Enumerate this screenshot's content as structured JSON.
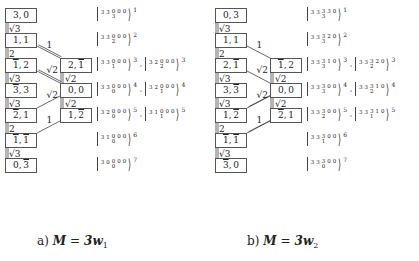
{
  "panels": [
    {
      "id": "a",
      "caption": {
        "prefix": "a)",
        "lhs": "M",
        "eq": "=",
        "rhs": "3w",
        "sub": "1"
      },
      "left_column": [
        {
          "a": "3",
          "a_bar": false,
          "b": "0",
          "b_bar": false
        },
        {
          "a": "1",
          "a_bar": false,
          "b": "1",
          "b_bar": false
        },
        {
          "a": "1",
          "a_bar": true,
          "b": "2",
          "b_bar": false
        },
        {
          "a": "3",
          "a_bar": true,
          "b": "3",
          "b_bar": false
        },
        {
          "a": "2",
          "a_bar": true,
          "b": "1",
          "b_bar": false
        },
        {
          "a": "1",
          "a_bar": true,
          "b": "1",
          "b_bar": true
        },
        {
          "a": "0",
          "a_bar": false,
          "b": "3",
          "b_bar": true
        }
      ],
      "left_links": [
        "√3",
        "2",
        "√3",
        "√3",
        "2",
        "√3"
      ],
      "right_column": [
        {
          "row": 3,
          "a": "2",
          "a_bar": false,
          "b": "1",
          "b_bar": true
        },
        {
          "row": 4,
          "a": "0",
          "a_bar": false,
          "b": "0",
          "b_bar": false
        },
        {
          "row": 5,
          "a": "1",
          "a_bar": false,
          "b": "2",
          "b_bar": true
        }
      ],
      "right_links": [
        "√2",
        "√2"
      ],
      "cross_links": [
        {
          "from_row": 2,
          "to_row": 3,
          "label": "1",
          "style": "double"
        },
        {
          "from_row": 3,
          "to_row": 4,
          "label": "√2",
          "style": "double"
        },
        {
          "from_row": 4,
          "to_row": 5,
          "label": "√2",
          "style": "single"
        },
        {
          "from_row": 5,
          "to_row": 6,
          "label": "1",
          "style": "single"
        }
      ],
      "kets": [
        [
          {
            "t": [
              "3",
              "3",
              "0",
              "0",
              "0"
            ],
            "mid_low": "3",
            "sup": "1"
          }
        ],
        [
          {
            "t": [
              "3",
              "3",
              "0",
              "0",
              "0"
            ],
            "mid_low": "2",
            "sup": "2"
          }
        ],
        [
          {
            "t": [
              "3",
              "3",
              "0",
              "0",
              "0"
            ],
            "mid_low": "1",
            "sup": "3"
          },
          {
            "t": [
              "3",
              "2",
              "0",
              "0",
              "0"
            ],
            "mid_low": "2",
            "sup": "3"
          }
        ],
        [
          {
            "t": [
              "3",
              "3",
              "0",
              "0",
              "0"
            ],
            "mid_low": "0",
            "sup": "4"
          },
          {
            "t": [
              "3",
              "2",
              "0",
              "0",
              "0"
            ],
            "mid_low": "1",
            "sup": "4"
          }
        ],
        [
          {
            "t": [
              "3",
              "2",
              "0",
              "0",
              "0"
            ],
            "mid_low": "0",
            "sup": "5"
          },
          {
            "t": [
              "3",
              "1",
              "0",
              "0",
              "0"
            ],
            "mid_low": "1",
            "sup": "5"
          }
        ],
        [
          {
            "t": [
              "3",
              "1",
              "0",
              "0",
              "0"
            ],
            "mid_low": "0",
            "sup": "6"
          }
        ],
        [
          {
            "t": [
              "3",
              "0",
              "0",
              "0",
              "0"
            ],
            "mid_low": "0",
            "sup": "7"
          }
        ]
      ]
    },
    {
      "id": "b",
      "caption": {
        "prefix": "b)",
        "lhs": "M",
        "eq": "=",
        "rhs": "3w",
        "sub": "2"
      },
      "left_column": [
        {
          "a": "0",
          "a_bar": false,
          "b": "3",
          "b_bar": false
        },
        {
          "a": "1",
          "a_bar": false,
          "b": "1",
          "b_bar": false
        },
        {
          "a": "2",
          "a_bar": false,
          "b": "1",
          "b_bar": true
        },
        {
          "a": "3",
          "a_bar": false,
          "b": "3",
          "b_bar": true
        },
        {
          "a": "1",
          "a_bar": false,
          "b": "2",
          "b_bar": true
        },
        {
          "a": "1",
          "a_bar": true,
          "b": "1",
          "b_bar": true
        },
        {
          "a": "3",
          "a_bar": true,
          "b": "0",
          "b_bar": false
        }
      ],
      "left_links": [
        "√3",
        "2",
        "√3",
        "√3",
        "2",
        "√3"
      ],
      "right_column": [
        {
          "row": 3,
          "a": "1",
          "a_bar": true,
          "b": "2",
          "b_bar": false
        },
        {
          "row": 4,
          "a": "0",
          "a_bar": false,
          "b": "0",
          "b_bar": false
        },
        {
          "row": 5,
          "a": "2",
          "a_bar": true,
          "b": "1",
          "b_bar": false
        }
      ],
      "right_links": [
        "√2",
        "√2"
      ],
      "cross_links": [
        {
          "from_row": 2,
          "to_row": 3,
          "label": "1",
          "style": "single"
        },
        {
          "from_row": 3,
          "to_row": 4,
          "label": "√2",
          "style": "single"
        },
        {
          "from_row": 4,
          "to_row": 5,
          "label": "√2",
          "style": "double"
        },
        {
          "from_row": 5,
          "to_row": 6,
          "label": "1",
          "style": "double"
        }
      ],
      "kets": [
        [
          {
            "t": [
              "3",
              "3",
              "3",
              "3",
              "0"
            ],
            "mid_low": "3",
            "sup": "1"
          }
        ],
        [
          {
            "t": [
              "3",
              "3",
              "3",
              "2",
              "0"
            ],
            "mid_low": "3",
            "sup": "2"
          }
        ],
        [
          {
            "t": [
              "3",
              "3",
              "3",
              "1",
              "0"
            ],
            "mid_low": "3",
            "sup": "3"
          },
          {
            "t": [
              "3",
              "3",
              "3",
              "2",
              "0"
            ],
            "mid_low": "2",
            "sup": "3"
          }
        ],
        [
          {
            "t": [
              "3",
              "3",
              "3",
              "0",
              "0"
            ],
            "mid_low": "3",
            "sup": "4"
          },
          {
            "t": [
              "3",
              "3",
              "3",
              "1",
              "0"
            ],
            "mid_low": "2",
            "sup": "4"
          }
        ],
        [
          {
            "t": [
              "3",
              "3",
              "3",
              "0",
              "0"
            ],
            "mid_low": "2",
            "sup": "5"
          },
          {
            "t": [
              "3",
              "3",
              "3",
              "1",
              "0"
            ],
            "mid_low": "1",
            "sup": "5"
          }
        ],
        [
          {
            "t": [
              "3",
              "3",
              "3",
              "0",
              "0"
            ],
            "mid_low": "1",
            "sup": "6"
          }
        ],
        [
          {
            "t": [
              "3",
              "3",
              "3",
              "0",
              "0"
            ],
            "mid_low": "0",
            "sup": "7"
          }
        ]
      ],
      "ket_separator": ","
    }
  ],
  "ket_separator": ","
}
